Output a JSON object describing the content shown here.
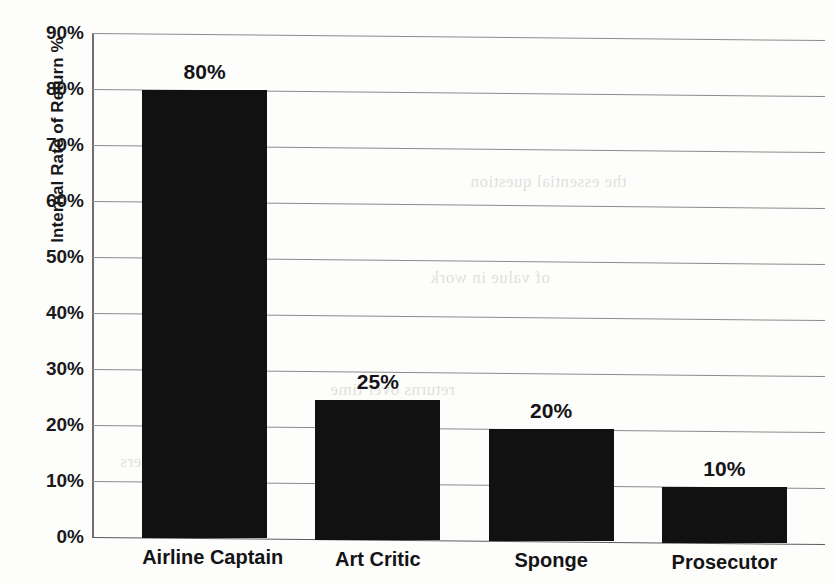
{
  "chart_data": {
    "type": "bar",
    "title": "",
    "xlabel": "",
    "ylabel": "Internal Rate of Return %",
    "categories": [
      "Airline Captain",
      "Art Critic",
      "Sponge",
      "Prosecutor"
    ],
    "values": [
      80,
      25,
      20,
      10
    ],
    "value_labels": [
      "80%",
      "25%",
      "20%",
      "10%"
    ],
    "ylim": [
      0,
      90
    ],
    "ytick_values": [
      0,
      10,
      20,
      30,
      40,
      50,
      60,
      70,
      80,
      90
    ],
    "ytick_labels": [
      "0%",
      "10%",
      "20%",
      "30%",
      "40%",
      "50%",
      "60%",
      "70%",
      "80%",
      "90%"
    ],
    "grid": true,
    "legend": false,
    "bar_color": "#111112",
    "gridline_color": "#8c8c8e"
  },
  "artifacts": {
    "bleed_lines": [
      "the essential question",
      "of value in work",
      "returns over time",
      "is what matters"
    ]
  }
}
